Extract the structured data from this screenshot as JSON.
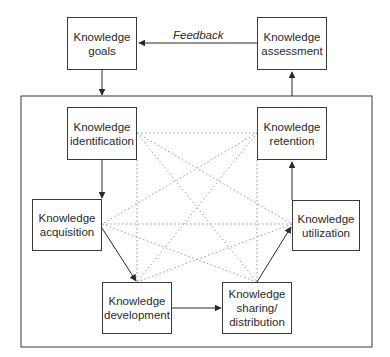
{
  "diagram": {
    "title": "",
    "nodes": [
      {
        "id": "goals",
        "label": "Knowledge\ngoals"
      },
      {
        "id": "assessment",
        "label": "Knowledge\nassessment"
      },
      {
        "id": "identification",
        "label": "Knowledge\nidentification"
      },
      {
        "id": "retention",
        "label": "Knowledge\nretention"
      },
      {
        "id": "acquisition",
        "label": "Knowledge\nacquisition"
      },
      {
        "id": "utilization",
        "label": "Knowledge\nutilization"
      },
      {
        "id": "development",
        "label": "Knowledge\ndevelopment"
      },
      {
        "id": "sharing",
        "label": "Knowledge\nsharing/\ndistribution"
      }
    ],
    "edges_solid": [
      {
        "from": "assessment",
        "to": "goals",
        "label": "Feedback"
      },
      {
        "from": "goals",
        "to": "inner-frame"
      },
      {
        "from": "inner-frame",
        "to": "assessment"
      },
      {
        "from": "identification",
        "to": "acquisition"
      },
      {
        "from": "acquisition",
        "to": "development"
      },
      {
        "from": "development",
        "to": "sharing"
      },
      {
        "from": "sharing",
        "to": "utilization"
      },
      {
        "from": "utilization",
        "to": "retention"
      }
    ],
    "edges_dotted": "all six inner building blocks interconnected",
    "feedback_label": "Feedback",
    "colors": {
      "line": "#3a3a3a",
      "dotted": "#9a9a9a",
      "text": "#2a2a2a"
    }
  }
}
